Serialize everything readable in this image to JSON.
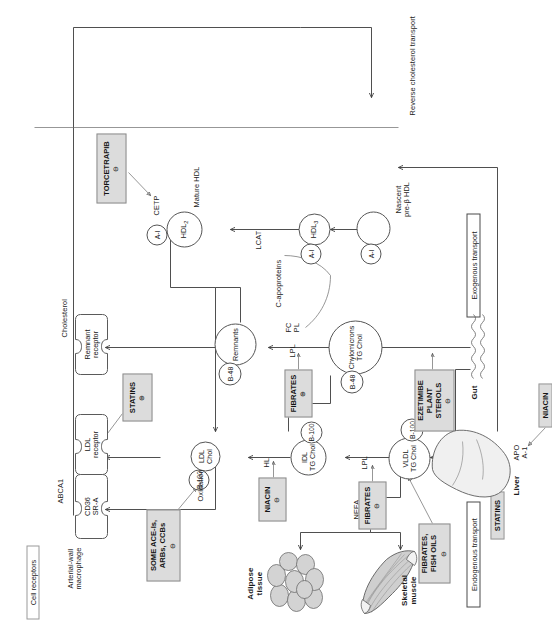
{
  "diagram": {
    "orientation": "rotated-90-ccw",
    "colors": {
      "drug_box_fill": "#dcdcdc",
      "drug_box_border": "#8d8d8d",
      "line": "#3b3b3b",
      "text": "#1c1c1c"
    }
  },
  "section_labels": {
    "cell_receptors": "Cell receptors",
    "endogenous": "Endogenous transport",
    "exogenous": "Exogenous transport",
    "reverse": "Reverse cholesterol transport"
  },
  "tissues": {
    "macrophage": "Arterial-wall\nmacrophage",
    "adipose": "Adipose\ntissue",
    "muscle": "Skeletal\nmuscle",
    "liver": "Liver",
    "gut": "Gut"
  },
  "receptors": [
    {
      "name": "cd36-sra",
      "label": "CD36\nSR-A"
    },
    {
      "name": "ldl-receptor",
      "label": "LDL\nreceptor"
    },
    {
      "name": "remnant-receptor",
      "label": "Remnant\nreceptor"
    }
  ],
  "transporter": {
    "abca1": "ABCA1"
  },
  "particles": [
    {
      "name": "ldl",
      "label": "LDL\nChol"
    },
    {
      "name": "idl",
      "label": "IDL\nTG Chol"
    },
    {
      "name": "vldl",
      "label": "VLDL\nTG Chol"
    },
    {
      "name": "chylomicrons",
      "label": "Chylomicrons\nTG Chol"
    },
    {
      "name": "remnants",
      "label": "Remnants"
    },
    {
      "name": "hdl2",
      "label": "HDL",
      "sub": "2"
    },
    {
      "name": "hdl3",
      "label": "HDL",
      "sub": "3"
    },
    {
      "name": "nascent-hdl",
      "label": ""
    }
  ],
  "apos": {
    "b100_ldl": "B-100",
    "b100_idl": "B-100",
    "b100_vldl": "B-100",
    "b48_remnants": "B-48",
    "b48_chylo": "B-48",
    "ai_hdl2": "A-I",
    "ai_hdl3": "A-I",
    "ai_nascent": "A-I"
  },
  "enzymes_labels": {
    "oxidation": "Oxidation",
    "hl": "HL",
    "lpl_vldl": "LPL",
    "lpl_chylo": "LPL",
    "lcat": "LCAT",
    "cetp": "CETP",
    "nefa": "NEFA",
    "cholesterol": "Cholesterol",
    "fc_pl": "FC\nPL",
    "c_apoproteins": "C-apoproteins",
    "bile_acids": "Bile acids\nFC, PL",
    "apo_a1": "APO\nA-1",
    "mature_hdl": "Mature HDL",
    "nascent_hdl": "Nascent\npre-β HDL"
  },
  "drugs": [
    {
      "name": "some-ace-arbs-ccbs",
      "label": "SOME ACE-Is,\nARBs, CCBs",
      "sign": "⊖"
    },
    {
      "name": "statins-ldl-receptor",
      "label": "STATINS",
      "sign": "⊕"
    },
    {
      "name": "niacin-hl",
      "label": "NIACIN",
      "sign": "⊖"
    },
    {
      "name": "torcetrapib",
      "label": "TORCETRAPIB",
      "sign": "⊖"
    },
    {
      "name": "fibrates-lpl-chylo",
      "label": "FIBRATES",
      "sign": "⊕"
    },
    {
      "name": "fibrates-lpl-vldl",
      "label": "FIBRATES",
      "sign": "⊖"
    },
    {
      "name": "fibrates-fish-oils",
      "label": "FIBRATES,\nFISH OILS",
      "sign": "⊖"
    },
    {
      "name": "ezetimibe-plant-sterols",
      "label": "EZETIMIBE\nPLANT STEROLS",
      "sign": "⊖"
    },
    {
      "name": "statins-liver",
      "label": "STATINS",
      "sign": ""
    },
    {
      "name": "niacin-apo",
      "label": "NIACIN",
      "sign": ""
    }
  ]
}
